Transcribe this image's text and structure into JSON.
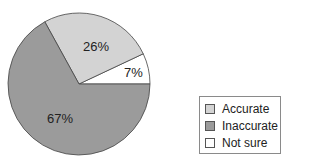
{
  "chart_data": {
    "type": "pie",
    "title": "",
    "categories": [
      "Accurate",
      "Inaccurate",
      "Not sure"
    ],
    "values": [
      26,
      67,
      7
    ],
    "labels": [
      "26%",
      "67%",
      "7%"
    ],
    "colors": [
      "#d3d3d3",
      "#9b9b9b",
      "#ffffff"
    ],
    "legend_position": "right",
    "start_angle_deg": 0,
    "direction": "counterclockwise"
  },
  "legend": {
    "items": [
      {
        "label": "Accurate",
        "color": "#d3d3d3"
      },
      {
        "label": "Inaccurate",
        "color": "#9b9b9b"
      },
      {
        "label": "Not sure",
        "color": "#ffffff"
      }
    ]
  }
}
